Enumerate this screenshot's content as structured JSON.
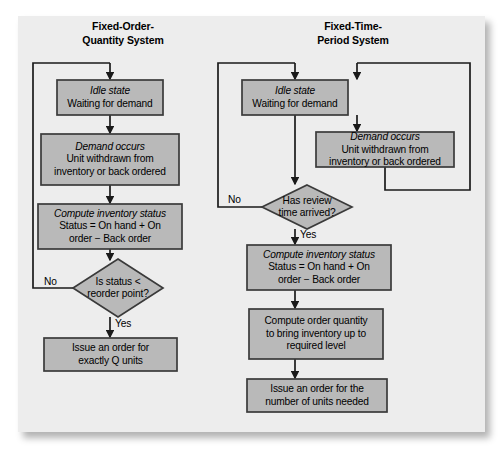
{
  "figure": {
    "panel_bg": "#ededed",
    "node_fill": "#b9b9b9",
    "node_stroke": "#3a3a3a",
    "line_color": "#1a1a1a"
  },
  "columns": [
    {
      "id": "fixed-order-quantity",
      "title_line1": "Fixed-Order-",
      "title_line2": "Quantity System",
      "nodes": [
        {
          "id": "idle-state",
          "shape": "process",
          "lines": [
            {
              "text": "Idle state",
              "italic": true
            },
            {
              "text": "Waiting for demand",
              "italic": false
            }
          ]
        },
        {
          "id": "demand-occurs",
          "shape": "process",
          "lines": [
            {
              "text": "Demand occurs",
              "italic": true
            },
            {
              "text": "Unit withdrawn from",
              "italic": false
            },
            {
              "text": "inventory or back ordered",
              "italic": false
            }
          ]
        },
        {
          "id": "compute-inventory-status",
          "shape": "process",
          "lines": [
            {
              "text": "Compute inventory status",
              "italic": true
            },
            {
              "text": "Status = On hand + On",
              "italic": false
            },
            {
              "text": "order  −  Back order",
              "italic": false
            }
          ]
        },
        {
          "id": "is-status-below-reorder-point",
          "shape": "decision",
          "lines": [
            {
              "text": "Is status <",
              "italic": false
            },
            {
              "text": "reorder point?",
              "italic": false
            }
          ]
        },
        {
          "id": "issue-order-exact-q",
          "shape": "process",
          "lines": [
            {
              "text": "Issue an order for",
              "italic": false
            },
            {
              "text": "exactly Q units",
              "italic": false
            }
          ]
        }
      ],
      "edge_labels": [
        {
          "id": "no-loop-label",
          "text": "No"
        },
        {
          "id": "yes-label",
          "text": "Yes"
        }
      ]
    },
    {
      "id": "fixed-time-period",
      "title_line1": "Fixed-Time-",
      "title_line2": "Period System",
      "nodes": [
        {
          "id": "idle-state",
          "shape": "process",
          "lines": [
            {
              "text": "Idle state",
              "italic": true
            },
            {
              "text": "Waiting for demand",
              "italic": false
            }
          ]
        },
        {
          "id": "demand-occurs",
          "shape": "process",
          "lines": [
            {
              "text": "Demand occurs",
              "italic": true
            },
            {
              "text": "Unit withdrawn from",
              "italic": false
            },
            {
              "text": "inventory or back ordered",
              "italic": false
            }
          ]
        },
        {
          "id": "has-review-time-arrived",
          "shape": "decision",
          "lines": [
            {
              "text": "Has review",
              "italic": false
            },
            {
              "text": "time arrived?",
              "italic": false
            }
          ]
        },
        {
          "id": "compute-inventory-status",
          "shape": "process",
          "lines": [
            {
              "text": "Compute inventory status",
              "italic": true
            },
            {
              "text": "Status = On hand + On",
              "italic": false
            },
            {
              "text": "order  −  Back order",
              "italic": false
            }
          ]
        },
        {
          "id": "compute-order-quantity",
          "shape": "process",
          "lines": [
            {
              "text": "Compute order quantity",
              "italic": false
            },
            {
              "text": "to bring inventory up to",
              "italic": false
            },
            {
              "text": "required level",
              "italic": false
            }
          ]
        },
        {
          "id": "issue-order-units-needed",
          "shape": "process",
          "lines": [
            {
              "text": "Issue an order for the",
              "italic": false
            },
            {
              "text": "number of units needed",
              "italic": false
            }
          ]
        }
      ],
      "edge_labels": [
        {
          "id": "no-loop-label",
          "text": "No"
        },
        {
          "id": "yes-label",
          "text": "Yes"
        }
      ]
    }
  ]
}
